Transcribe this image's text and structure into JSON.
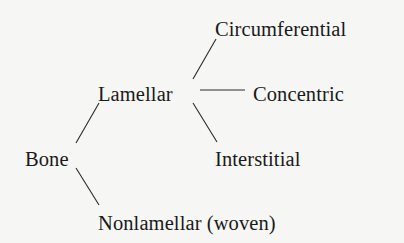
{
  "diagram": {
    "type": "tree",
    "root": "Bone",
    "nodes": {
      "bone": "Bone",
      "lamellar": "Lamellar",
      "nonlamellar": "Nonlamellar (woven)",
      "circumferential": "Circumferential",
      "concentric": "Concentric",
      "interstitial": "Interstitial"
    },
    "edges": [
      {
        "from": "Bone",
        "to": "Lamellar"
      },
      {
        "from": "Bone",
        "to": "Nonlamellar (woven)"
      },
      {
        "from": "Lamellar",
        "to": "Circumferential"
      },
      {
        "from": "Lamellar",
        "to": "Concentric"
      },
      {
        "from": "Lamellar",
        "to": "Interstitial"
      }
    ]
  }
}
